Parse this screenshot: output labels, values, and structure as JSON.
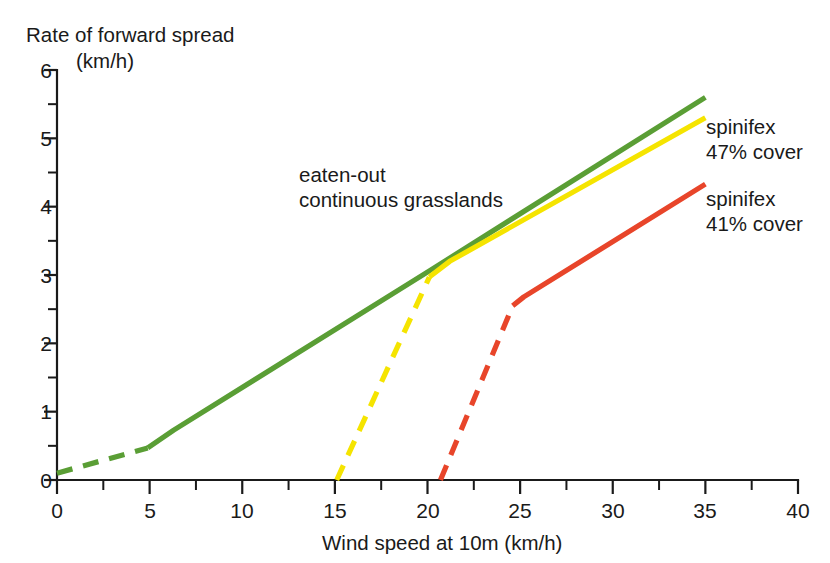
{
  "chart_data": {
    "type": "line",
    "title": "Rate of forward spread (km/h)",
    "title_line1": "Rate of forward spread",
    "title_line2": "(km/h)",
    "xlabel": "Wind speed at 10m (km/h)",
    "ylabel": "Rate of forward spread (km/h)",
    "xlim": [
      0,
      40
    ],
    "ylim": [
      0,
      6
    ],
    "x_ticks": [
      0,
      5,
      10,
      15,
      20,
      25,
      30,
      35,
      40
    ],
    "x_tick_labels": [
      "0",
      "5",
      "10",
      "15",
      "20",
      "25",
      "30",
      "35",
      "40"
    ],
    "x_minor_step": 2.5,
    "y_ticks": [
      0,
      1,
      2,
      3,
      4,
      5,
      6
    ],
    "y_tick_labels": [
      "0",
      "1",
      "2",
      "3",
      "4",
      "5",
      "6"
    ],
    "y_minor_step": 0.5,
    "grid": false,
    "legend_position": "right-inline",
    "series": [
      {
        "name": "eaten-out continuous grasslands",
        "color": "#5a9e35",
        "label_line1": "eaten-out",
        "label_line2": "continuous grasslands",
        "label_kind": "annotation",
        "dashed_points": [
          [
            0,
            0.1
          ],
          [
            4.9,
            0.47
          ]
        ],
        "solid_points": [
          [
            4.9,
            0.47
          ],
          [
            6.3,
            0.73
          ],
          [
            20.1,
            3.06
          ],
          [
            35.0,
            5.6
          ]
        ]
      },
      {
        "name": "spinifex 47% cover",
        "color": "#f5e400",
        "label_line1": "spinifex",
        "label_line2": "47% cover",
        "label_kind": "legend",
        "dashed_points": [
          [
            15.1,
            0.0
          ],
          [
            20.1,
            2.97
          ]
        ],
        "solid_points": [
          [
            20.1,
            2.97
          ],
          [
            21.2,
            3.2
          ],
          [
            35.0,
            5.3
          ]
        ]
      },
      {
        "name": "spinifex 41% cover",
        "color": "#e8452a",
        "label_line1": "spinifex",
        "label_line2": "41% cover",
        "label_kind": "legend",
        "dashed_points": [
          [
            20.7,
            0.0
          ],
          [
            24.6,
            2.55
          ]
        ],
        "solid_points": [
          [
            24.6,
            2.55
          ],
          [
            25.2,
            2.68
          ],
          [
            35.0,
            4.33
          ]
        ]
      }
    ]
  },
  "annotations": {
    "grasslands_line1": "eaten-out",
    "grasslands_line2": "continuous grasslands"
  },
  "legend": {
    "entries": [
      {
        "line1": "spinifex",
        "line2": "47% cover",
        "color": "#f5e400"
      },
      {
        "line1": "spinifex",
        "line2": "41% cover",
        "color": "#e8452a"
      }
    ]
  },
  "colors": {
    "grasslands_green": "#5a9e35",
    "spinifex47_yellow": "#f5e400",
    "spinifex41_red": "#e8452a",
    "axis_black": "#1a1a1a",
    "background": "#ffffff"
  }
}
